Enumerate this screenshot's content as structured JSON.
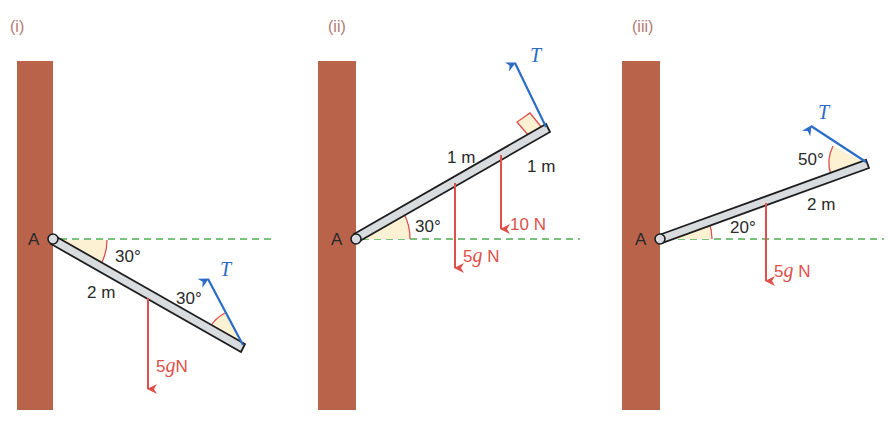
{
  "colors": {
    "wall": "#b8634a",
    "rod_fill": "#d9dcdf",
    "rod_stroke": "#1e1e1e",
    "dashed_line": "#4caf50",
    "weight_force": "#e0504a",
    "tension": "#2b6cc4",
    "angle_fill": "#fdf1d4",
    "angle_arc": "#e0504a",
    "panel_label": "#b57a72"
  },
  "panels": [
    {
      "label": "(i)",
      "pivot_label": "A",
      "rod_angle_label": "30°",
      "length_label": "2 m",
      "tension_angle_label": "30°",
      "tension_label": "T",
      "forces": [
        {
          "value": "5",
          "g": "g",
          "unit": "N"
        }
      ]
    },
    {
      "label": "(ii)",
      "pivot_label": "A",
      "rod_angle_label": "30°",
      "length_labels": [
        "1 m",
        "1 m"
      ],
      "tension_label": "T",
      "forces": [
        {
          "value": "5",
          "g": "g",
          "unit": " N"
        },
        {
          "value": "10 N"
        }
      ]
    },
    {
      "label": "(iii)",
      "pivot_label": "A",
      "rod_angle_label": "20°",
      "length_label": "2 m",
      "tension_angle_label": "50°",
      "tension_label": "T",
      "forces": [
        {
          "value": "5",
          "g": "g",
          "unit": " N"
        }
      ]
    }
  ]
}
